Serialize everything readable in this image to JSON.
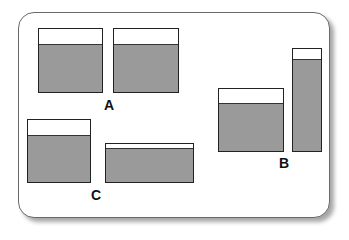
{
  "diagram": {
    "type": "liquid containers comparison",
    "colors": {
      "liquid": "#9a9a9a",
      "outline": "#222222",
      "background": "#ffffff"
    },
    "groups": [
      {
        "label": "A",
        "label_pos": [
          104,
          97
        ],
        "containers": [
          {
            "x": 38,
            "y": 28,
            "w": 65,
            "h": 65,
            "fill_h": 47
          },
          {
            "x": 113,
            "y": 28,
            "w": 66,
            "h": 65,
            "fill_h": 47
          }
        ]
      },
      {
        "label": "B",
        "label_pos": [
          279,
          155
        ],
        "containers": [
          {
            "x": 218,
            "y": 88,
            "w": 66,
            "h": 64,
            "fill_h": 47
          },
          {
            "x": 292,
            "y": 48,
            "w": 30,
            "h": 104,
            "fill_h": 91
          }
        ]
      },
      {
        "label": "C",
        "label_pos": [
          91,
          187
        ],
        "containers": [
          {
            "x": 27,
            "y": 119,
            "w": 64,
            "h": 64,
            "fill_h": 46
          },
          {
            "x": 105,
            "y": 143,
            "w": 89,
            "h": 40,
            "fill_h": 33
          }
        ]
      }
    ]
  }
}
